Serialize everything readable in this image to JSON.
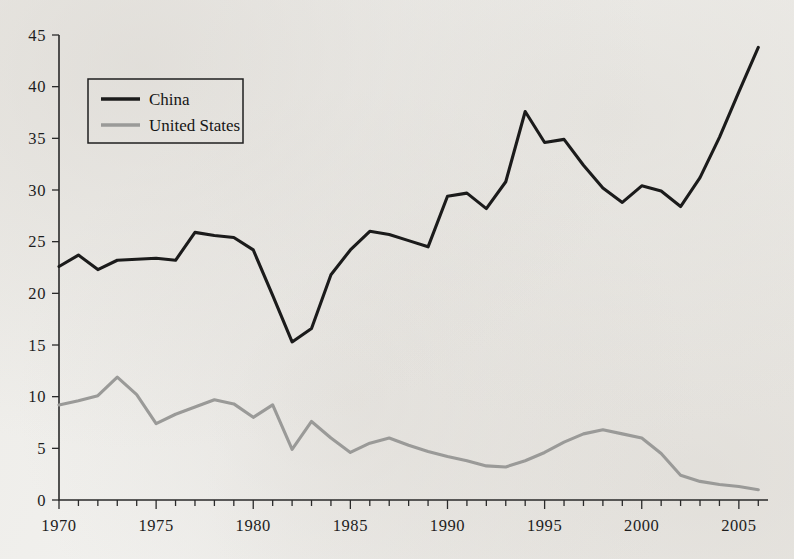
{
  "figure": {
    "background_color": "#f2f2f0",
    "axis_color": "#2a2a2a"
  },
  "legend": {
    "position": "top-left-inside",
    "entries": [
      {
        "label": "China",
        "color": "#1b1b1b"
      },
      {
        "label": "United States",
        "color": "#9a9a98"
      }
    ]
  },
  "chart_data": {
    "type": "line",
    "title": "",
    "subtitle": "",
    "xlabel": "",
    "ylabel": "",
    "xlim": [
      1969.5,
      2006.5
    ],
    "ylim": [
      0,
      45
    ],
    "grid": false,
    "legend_position": "upper left",
    "y_ticks": [
      0,
      5,
      10,
      15,
      20,
      25,
      30,
      35,
      40,
      45
    ],
    "y_tick_labels": [
      "0",
      "5",
      "10",
      "15",
      "20",
      "25",
      "30",
      "35",
      "40",
      "45"
    ],
    "x_ticks": [
      1970,
      1971,
      1972,
      1973,
      1974,
      1975,
      1976,
      1977,
      1978,
      1979,
      1980,
      1981,
      1982,
      1983,
      1984,
      1985,
      1986,
      1987,
      1988,
      1989,
      1990,
      1991,
      1992,
      1993,
      1994,
      1995,
      1996,
      1997,
      1998,
      1999,
      2000,
      2001,
      2002,
      2003,
      2004,
      2005,
      2006
    ],
    "x_tick_labels": [
      "1970",
      "1975",
      "1980",
      "1985",
      "1990",
      "1995",
      "2000",
      "2005"
    ],
    "x_labeled_ticks": [
      1970,
      1975,
      1980,
      1985,
      1990,
      1995,
      2000,
      2005
    ],
    "x": [
      1970,
      1971,
      1972,
      1973,
      1974,
      1975,
      1976,
      1977,
      1978,
      1979,
      1980,
      1981,
      1982,
      1983,
      1984,
      1985,
      1986,
      1987,
      1988,
      1989,
      1990,
      1991,
      1992,
      1993,
      1994,
      1995,
      1996,
      1997,
      1998,
      1999,
      2000,
      2001,
      2002,
      2003,
      2004,
      2005,
      2006
    ],
    "series": [
      {
        "name": "China",
        "color": "#1b1b1b",
        "line_width": 3.1,
        "values": [
          22.6,
          23.7,
          22.3,
          23.2,
          23.3,
          23.4,
          23.2,
          25.9,
          25.6,
          25.4,
          24.2,
          19.8,
          15.3,
          16.6,
          21.8,
          24.2,
          26.0,
          25.7,
          25.1,
          24.5,
          29.4,
          29.7,
          28.2,
          30.8,
          37.6,
          34.6,
          34.9,
          32.4,
          30.2,
          28.8,
          30.4,
          29.9,
          28.4,
          31.2,
          35.1,
          39.5,
          43.8
        ]
      },
      {
        "name": "United States",
        "color": "#9a9a98",
        "line_width": 3.1,
        "values": [
          9.2,
          9.6,
          10.1,
          11.9,
          10.2,
          7.4,
          8.3,
          9.0,
          9.7,
          9.3,
          8.0,
          9.2,
          4.9,
          7.6,
          6.0,
          4.6,
          5.5,
          6.0,
          5.3,
          4.7,
          4.2,
          3.8,
          3.3,
          3.2,
          3.8,
          4.6,
          5.6,
          6.4,
          6.8,
          6.4,
          6.0,
          4.5,
          2.4,
          1.8,
          1.5,
          1.3,
          1.0
        ]
      }
    ]
  }
}
